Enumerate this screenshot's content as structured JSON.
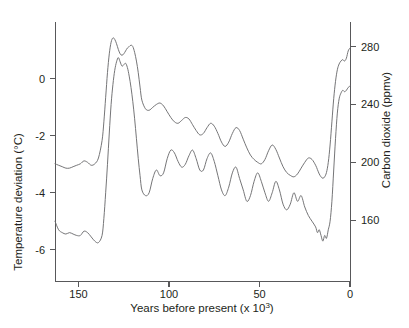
{
  "chart_data": {
    "type": "line",
    "title": "",
    "xlabel": "Years before present (x 10³)",
    "xlabel_base": "Years before present (x 10",
    "xlabel_exp": "3",
    "xlabel_close": ")",
    "xlim": [
      163,
      0
    ],
    "x_inverted": true,
    "xticks": [
      150,
      100,
      50,
      0
    ],
    "xticklabels": [
      "150",
      "100",
      "50",
      "0"
    ],
    "grid": false,
    "legend": "none",
    "axes": {
      "left": {
        "label": "Temperature deviation (°C)",
        "unit": "°C",
        "ticks": [
          0,
          -2,
          -4,
          -6
        ],
        "ticklabels": [
          "0",
          "-2",
          "-4",
          "-6"
        ],
        "range": [
          -7.1,
          2.0
        ]
      },
      "right": {
        "label": "Carbon dioxide (ppmv)",
        "unit": "ppmv",
        "ticks": [
          280,
          240,
          200,
          160
        ],
        "ticklabels": [
          "280",
          "240",
          "200",
          "160"
        ],
        "range": [
          118,
          297
        ]
      }
    },
    "colors": {
      "line": "#6e6e70",
      "axis": "#58585a",
      "text": "#231f20",
      "background": "#ffffff"
    },
    "series": [
      {
        "name": "Carbon dioxide",
        "axis": "right",
        "unit": "ppmv",
        "x": [
          163,
          161,
          159,
          157,
          155,
          153,
          151,
          149,
          147,
          145,
          143,
          141,
          139,
          137,
          136,
          135,
          134,
          133,
          132,
          131,
          130,
          129,
          128,
          127,
          126,
          125,
          124,
          123,
          122,
          121,
          120,
          119,
          118,
          117,
          116,
          115,
          113,
          111,
          109,
          107,
          105,
          103,
          101,
          99,
          97,
          95,
          93,
          91,
          89,
          87,
          85,
          83,
          81,
          79,
          77,
          75,
          73,
          71,
          69,
          67,
          65,
          63,
          61,
          59,
          57,
          55,
          53,
          51,
          49,
          47,
          45,
          43,
          41,
          39,
          37,
          35,
          33,
          31,
          29,
          27,
          25,
          23,
          21,
          19,
          18,
          17,
          16,
          15,
          14,
          13,
          12,
          11,
          10,
          9,
          8,
          7,
          6,
          5,
          4,
          3,
          2,
          1,
          0
        ],
        "y": [
          199,
          198,
          197,
          196,
          196,
          197,
          198,
          199,
          201,
          200,
          198,
          199,
          203,
          215,
          228,
          245,
          262,
          275,
          283,
          286,
          285,
          282,
          278,
          275,
          274,
          275,
          277,
          279,
          280,
          281,
          280,
          276,
          270,
          262,
          252,
          243,
          237,
          236,
          238,
          240,
          241,
          239,
          235,
          231,
          228,
          227,
          229,
          231,
          230,
          226,
          222,
          219,
          220,
          224,
          227,
          225,
          220,
          214,
          211,
          214,
          220,
          224,
          222,
          216,
          210,
          205,
          202,
          200,
          199,
          202,
          208,
          212,
          209,
          203,
          197,
          193,
          191,
          190,
          192,
          196,
          200,
          203,
          202,
          198,
          195,
          192,
          190,
          189,
          190,
          193,
          200,
          212,
          228,
          244,
          256,
          264,
          268,
          270,
          271,
          270,
          272,
          277,
          279
        ]
      },
      {
        "name": "Temperature deviation",
        "axis": "left",
        "unit": "°C",
        "x": [
          163,
          161,
          159,
          157,
          155,
          153,
          151,
          149,
          147,
          145,
          143,
          141,
          139,
          137,
          136,
          135,
          134,
          133,
          132,
          131,
          130,
          129,
          128,
          127,
          126,
          125,
          124,
          123,
          122,
          121,
          120,
          119,
          118,
          117,
          116,
          115,
          113,
          111,
          109,
          107,
          105,
          103,
          101,
          99,
          97,
          95,
          93,
          91,
          89,
          87,
          85,
          83,
          81,
          79,
          77,
          75,
          73,
          71,
          69,
          67,
          65,
          63,
          61,
          59,
          57,
          55,
          53,
          51,
          49,
          47,
          45,
          43,
          41,
          39,
          37,
          35,
          33,
          31,
          29,
          27,
          25,
          23,
          21,
          19,
          18,
          17,
          16,
          15,
          14,
          13,
          12,
          11,
          10,
          9,
          8,
          7,
          6,
          5,
          4,
          3,
          2,
          1,
          0
        ],
        "y": [
          -5.0,
          -5.3,
          -5.4,
          -5.45,
          -5.4,
          -5.45,
          -5.5,
          -5.5,
          -5.35,
          -5.4,
          -5.55,
          -5.7,
          -5.75,
          -5.5,
          -4.9,
          -4.0,
          -3.0,
          -1.9,
          -0.9,
          -0.2,
          0.3,
          0.6,
          0.75,
          0.6,
          0.45,
          0.5,
          0.55,
          0.4,
          0.1,
          -0.3,
          -0.8,
          -1.4,
          -2.1,
          -2.8,
          -3.4,
          -3.9,
          -4.1,
          -4.0,
          -3.5,
          -3.2,
          -3.4,
          -3.3,
          -2.8,
          -2.5,
          -2.6,
          -2.9,
          -3.1,
          -3.0,
          -2.7,
          -2.5,
          -2.8,
          -3.2,
          -3.2,
          -2.8,
          -2.6,
          -2.9,
          -3.4,
          -3.9,
          -4.1,
          -3.8,
          -3.3,
          -3.1,
          -3.5,
          -3.9,
          -4.3,
          -4.1,
          -3.6,
          -3.3,
          -3.6,
          -4.0,
          -4.3,
          -4.0,
          -3.6,
          -3.9,
          -4.4,
          -4.6,
          -4.4,
          -4.0,
          -4.3,
          -4.1,
          -4.5,
          -4.8,
          -5.0,
          -5.2,
          -5.4,
          -5.3,
          -5.5,
          -5.7,
          -5.5,
          -5.6,
          -5.3,
          -5.0,
          -4.3,
          -3.2,
          -2.1,
          -1.2,
          -0.7,
          -0.5,
          -0.4,
          -0.45,
          -0.4,
          -0.3,
          -0.25
        ]
      }
    ]
  }
}
